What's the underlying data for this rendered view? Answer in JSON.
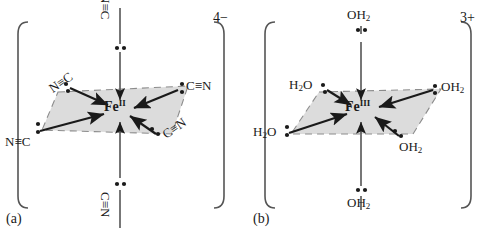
{
  "colors": {
    "ink": "#1a1a1a",
    "plane_fill": "#dcdcdc",
    "plane_edge": "#8c8c8c",
    "bond_line": "#555555",
    "triple_bond": "#8a8a8a",
    "bracket": "#555555"
  },
  "panels": [
    {
      "id": "a",
      "tag": "(a)",
      "charge": "4−",
      "metal": {
        "symbol": "Fe",
        "oxidation": "II"
      },
      "ligands": [
        {
          "position": "axial-top",
          "name": "cyanide-ligand-axial-top",
          "formula": "N≡C",
          "lone_pair": "below"
        },
        {
          "position": "axial-bottom",
          "name": "cyanide-ligand-axial-bottom",
          "formula": "C≡N",
          "lone_pair": "above"
        },
        {
          "position": "equatorial-upper-left",
          "name": "cyanide-ligand-upper-left",
          "formula": "N≡C",
          "lone_pair": "right"
        },
        {
          "position": "equatorial-lower-left",
          "name": "cyanide-ligand-lower-left",
          "formula": "N≡C",
          "lone_pair": "right"
        },
        {
          "position": "equatorial-right",
          "name": "cyanide-ligand-right",
          "formula": "C≡N",
          "lone_pair": "left"
        },
        {
          "position": "equatorial-lower-right",
          "name": "cyanide-ligand-lower-right",
          "formula": "C≡N",
          "lone_pair": "left"
        }
      ]
    },
    {
      "id": "b",
      "tag": "(b)",
      "charge": "3+",
      "metal": {
        "symbol": "Fe",
        "oxidation": "III"
      },
      "ligands": [
        {
          "position": "axial-top",
          "name": "aqua-ligand-axial-top",
          "formula": "OH2",
          "lone_pair": "below"
        },
        {
          "position": "axial-bottom",
          "name": "aqua-ligand-axial-bottom",
          "formula": "OH2",
          "lone_pair": "above"
        },
        {
          "position": "equatorial-upper-left",
          "name": "aqua-ligand-upper-left",
          "formula": "H2O",
          "lone_pair": "right"
        },
        {
          "position": "equatorial-lower-left",
          "name": "aqua-ligand-lower-left",
          "formula": "H2O",
          "lone_pair": "right"
        },
        {
          "position": "equatorial-right",
          "name": "aqua-ligand-right",
          "formula": "OH2",
          "lone_pair": "left"
        },
        {
          "position": "equatorial-lower-right",
          "name": "aqua-ligand-lower-right",
          "formula": "OH2",
          "lone_pair": "left"
        }
      ]
    }
  ],
  "text": {
    "a_tag": "(a)",
    "b_tag": "(b)",
    "a_charge": "4−",
    "b_charge": "3+",
    "a_metal_symbol": "Fe",
    "a_metal_ox": "II",
    "b_metal_symbol": "Fe",
    "b_metal_ox": "III",
    "NC": "N≡C",
    "CN": "C≡N",
    "OH": "OH",
    "H": "H",
    "O": "O",
    "two": "2"
  }
}
